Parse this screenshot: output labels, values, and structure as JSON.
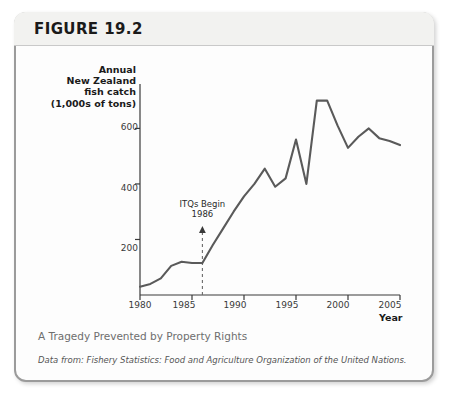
{
  "figure": {
    "number_label": "FIGURE 19.2",
    "caption": "A Tragedy Prevented by Property Rights",
    "source": "Data from: Fishery Statistics: Food and Agriculture Organization of the United Nations."
  },
  "colors": {
    "line": "#5a5a5a",
    "axis": "#3a3a3a",
    "frame": "#9b9b9b",
    "header_band": "#f2f2f0",
    "caption_text": "#6e6e6e",
    "source_text": "#555555"
  },
  "axis_label_lines": [
    "Annual",
    "New Zealand",
    "fish catch",
    "(1,000s of tons)"
  ],
  "chart_data": {
    "type": "line",
    "title": "",
    "xlabel": "Year",
    "ylabel": "Annual New Zealand fish catch (1,000s of tons)",
    "xlim": [
      1980,
      2005
    ],
    "ylim": [
      0,
      760
    ],
    "xticks": [
      1980,
      1985,
      1990,
      1995,
      2000,
      2005
    ],
    "xtick_labels": [
      "1980",
      "1985",
      "1990",
      "1995",
      "2000",
      "2005"
    ],
    "yticks": [
      200,
      400,
      600
    ],
    "ytick_labels": [
      "200",
      "400",
      "600"
    ],
    "grid": false,
    "legend": false,
    "x": [
      1980,
      1981,
      1982,
      1983,
      1984,
      1985,
      1986,
      1987,
      1988,
      1989,
      1990,
      1991,
      1992,
      1993,
      1994,
      1995,
      1996,
      1997,
      1998,
      1999,
      2000,
      2001,
      2002,
      2003,
      2004,
      2005
    ],
    "values": [
      30,
      40,
      60,
      105,
      120,
      115,
      115,
      180,
      240,
      300,
      355,
      400,
      455,
      390,
      420,
      560,
      400,
      700,
      700,
      610,
      530,
      570,
      600,
      565,
      555,
      540
    ],
    "series": [
      {
        "name": "Annual New Zealand fish catch",
        "values": [
          30,
          40,
          60,
          105,
          120,
          115,
          115,
          180,
          240,
          300,
          355,
          400,
          455,
          390,
          420,
          560,
          400,
          700,
          700,
          610,
          530,
          570,
          600,
          565,
          555,
          540
        ]
      }
    ],
    "annotations": [
      {
        "text_line1": "ITQs Begin",
        "text_line2": "1986",
        "x": 1986,
        "style": "dashed vertical line with up arrow"
      }
    ]
  }
}
